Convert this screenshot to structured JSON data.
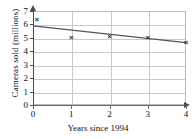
{
  "chart_data": {
    "type": "scatter",
    "title": "",
    "xlabel": "Years since 1994",
    "ylabel": "Cameras sold (millions)",
    "xlim": [
      0,
      4
    ],
    "ylim": [
      0,
      7
    ],
    "grid": true,
    "legend": "none",
    "x_ticks": [
      "0",
      "1",
      "2",
      "3",
      "4"
    ],
    "y_ticks": [
      "0",
      "1",
      "2",
      "3",
      "4",
      "5",
      "6",
      "7"
    ],
    "points": [
      {
        "x": 0.1,
        "y": 6.3,
        "marker": "x"
      },
      {
        "x": 1.0,
        "y": 5.0,
        "marker": "x"
      },
      {
        "x": 2.0,
        "y": 5.05,
        "marker": "x"
      },
      {
        "x": 3.0,
        "y": 5.0,
        "marker": "x"
      },
      {
        "x": 4.0,
        "y": 4.65,
        "marker": "x"
      }
    ],
    "series": [
      {
        "name": "line of best fit",
        "type": "line",
        "x": [
          0,
          4
        ],
        "values": [
          5.9,
          4.65
        ]
      }
    ],
    "colors": {
      "marker": "#2b2b2b",
      "line": "#555555",
      "grid": "#c9c9c9",
      "axis": "#4a4a4a",
      "background": "#ffffff"
    }
  }
}
